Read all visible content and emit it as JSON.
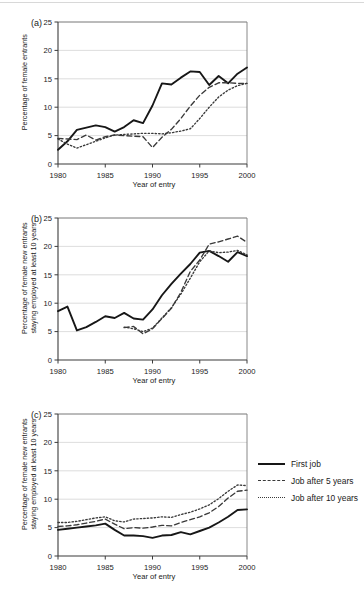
{
  "figure": {
    "panels": [
      {
        "id": "a",
        "label": "(a)",
        "ylabel_lines": [
          "Percentage of female entrants"
        ],
        "xlabel": "Year of entry"
      },
      {
        "id": "b",
        "label": "(b)",
        "ylabel_lines": [
          "Percentage of female new entrants",
          "staying employed at least 10 years"
        ],
        "xlabel": "Year of entry"
      },
      {
        "id": "c",
        "label": "(c)",
        "ylabel_lines": [
          "Percentage of female new entrants",
          "staying employed at least 10 years"
        ],
        "xlabel": "Year of entry"
      }
    ],
    "legend": {
      "position": "right-of-panel-c",
      "entries": [
        {
          "label": "First job",
          "style": "solid",
          "color": "#171717"
        },
        {
          "label": "Job after 5 years",
          "style": "dashed",
          "color": "#3a3a3a"
        },
        {
          "label": "Job after 10 years",
          "style": "dotted",
          "color": "#3a3a3a"
        }
      ]
    }
  },
  "chart_data": [
    {
      "id": "a",
      "type": "line",
      "title": "(a)",
      "xlabel": "Year of entry",
      "ylabel": "Percentage of female entrants",
      "xlim": [
        1980,
        2000
      ],
      "ylim": [
        0,
        25
      ],
      "xticks": [
        1980,
        1985,
        1990,
        1995,
        2000
      ],
      "yticks": [
        0,
        5,
        10,
        15,
        20,
        25
      ],
      "grid": "horizontal",
      "x": [
        1980,
        1981,
        1982,
        1983,
        1984,
        1985,
        1986,
        1987,
        1988,
        1989,
        1990,
        1991,
        1992,
        1993,
        1994,
        1995,
        1996,
        1997,
        1998,
        1999,
        2000
      ],
      "series": [
        {
          "name": "First job",
          "style": "solid",
          "values": [
            2.5,
            4.0,
            6.0,
            6.4,
            6.8,
            6.5,
            5.7,
            6.5,
            7.7,
            7.2,
            10.3,
            14.2,
            14.0,
            15.2,
            16.3,
            16.2,
            13.9,
            15.5,
            14.2,
            15.9,
            17.0
          ]
        },
        {
          "name": "Job after 5 years",
          "style": "dashed",
          "values": [
            4.5,
            4.4,
            4.3,
            5.1,
            4.2,
            4.8,
            5.1,
            5.0,
            4.9,
            4.8,
            2.9,
            4.7,
            6.1,
            8.0,
            10.2,
            12.1,
            13.5,
            14.3,
            14.3,
            14.2,
            14.2
          ]
        },
        {
          "name": "Job after 10 years",
          "style": "dotted",
          "values": [
            4.4,
            3.5,
            2.8,
            3.4,
            4.0,
            4.6,
            5.1,
            5.2,
            5.3,
            5.4,
            5.4,
            5.3,
            5.5,
            5.8,
            6.2,
            8.0,
            10.0,
            11.8,
            13.0,
            13.8,
            14.2
          ]
        }
      ]
    },
    {
      "id": "b",
      "type": "line",
      "title": "(b)",
      "xlabel": "Year of entry",
      "ylabel": "Percentage of female new entrants staying employed at least 10 years",
      "xlim": [
        1980,
        2000
      ],
      "ylim": [
        0,
        25
      ],
      "xticks": [
        1980,
        1985,
        1990,
        1995,
        2000
      ],
      "yticks": [
        0,
        5,
        10,
        15,
        20,
        25
      ],
      "grid": "horizontal",
      "x": [
        1980,
        1981,
        1982,
        1983,
        1984,
        1985,
        1986,
        1987,
        1988,
        1989,
        1990,
        1991,
        1992,
        1993,
        1994,
        1995,
        1996,
        1997,
        1998,
        1999,
        2000
      ],
      "series": [
        {
          "name": "First job",
          "style": "solid",
          "values": [
            8.6,
            9.4,
            5.2,
            5.8,
            6.7,
            7.7,
            7.4,
            8.3,
            7.3,
            7.1,
            8.9,
            11.4,
            13.4,
            15.2,
            16.9,
            18.9,
            19.2,
            18.3,
            17.3,
            19.0,
            18.3
          ]
        },
        {
          "name": "Job after 5 years",
          "style": "dashed",
          "values": [
            null,
            null,
            null,
            null,
            null,
            null,
            null,
            5.7,
            5.9,
            4.6,
            5.5,
            7.3,
            9.1,
            11.9,
            15.6,
            17.6,
            20.4,
            20.8,
            21.3,
            21.8,
            20.7
          ]
        },
        {
          "name": "Job after 10 years",
          "style": "dotted",
          "values": [
            null,
            null,
            null,
            null,
            null,
            null,
            null,
            5.8,
            5.5,
            5.0,
            5.6,
            7.4,
            9.2,
            11.6,
            14.4,
            17.3,
            19.2,
            18.9,
            19.0,
            19.3,
            18.5
          ]
        }
      ]
    },
    {
      "id": "c",
      "type": "line",
      "title": "(c)",
      "xlabel": "Year of entry",
      "ylabel": "Percentage of female new entrants staying employed at least 10 years",
      "xlim": [
        1980,
        2000
      ],
      "ylim": [
        0,
        25
      ],
      "xticks": [
        1980,
        1985,
        1990,
        1995,
        2000
      ],
      "yticks": [
        0,
        5,
        10,
        15,
        20,
        25
      ],
      "grid": "horizontal",
      "x": [
        1980,
        1981,
        1982,
        1983,
        1984,
        1985,
        1986,
        1987,
        1988,
        1989,
        1990,
        1991,
        1992,
        1993,
        1994,
        1995,
        1996,
        1997,
        1998,
        1999,
        2000
      ],
      "series": [
        {
          "name": "First job",
          "style": "solid",
          "values": [
            4.6,
            4.8,
            5.0,
            5.2,
            5.4,
            5.7,
            4.6,
            3.6,
            3.6,
            3.5,
            3.2,
            3.6,
            3.7,
            4.2,
            3.8,
            4.4,
            5.0,
            5.9,
            6.9,
            8.1,
            8.2
          ]
        },
        {
          "name": "Job after 5 years",
          "style": "dashed",
          "values": [
            5.2,
            5.3,
            5.5,
            5.8,
            6.1,
            6.5,
            5.6,
            4.8,
            5.0,
            4.9,
            5.1,
            5.4,
            5.3,
            5.9,
            6.4,
            6.9,
            7.6,
            8.7,
            10.2,
            11.4,
            11.6
          ]
        },
        {
          "name": "Job after 10 years",
          "style": "dotted",
          "values": [
            5.9,
            5.9,
            6.1,
            6.4,
            6.7,
            6.9,
            6.2,
            6.0,
            6.5,
            6.6,
            6.7,
            6.9,
            6.8,
            7.3,
            7.7,
            8.3,
            9.0,
            10.1,
            11.4,
            12.5,
            12.4
          ]
        }
      ]
    }
  ]
}
